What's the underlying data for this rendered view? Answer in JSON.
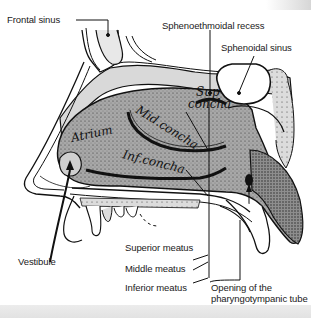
{
  "figure": {
    "colors": {
      "background": "#ffffff",
      "mucosa": "#a9a9a9",
      "bone": "#d8d8d8",
      "line": "#111111",
      "bottom_strip": "#e6e6e6"
    }
  },
  "labels": {
    "frontal_sinus": "Frontal sinus",
    "sphenoethmoidal_recess": "Sphenoethmoidal recess",
    "sphenoidal_sinus": "Sphenoidal sinus",
    "vestibule": "Vestibule",
    "superior_meatus": "Superior meatus",
    "middle_meatus": "Middle meatus",
    "inferior_meatus": "Inferior meatus",
    "pharyngotympanic_opening": "Opening of the\npharyngotympanic tube"
  },
  "handwritten": {
    "sup_concha_1": "Sup",
    "sup_concha_2": "concha",
    "mid_concha": "Mid.concha",
    "inf_concha": "Inf.concha",
    "atrium": "Atrium"
  }
}
